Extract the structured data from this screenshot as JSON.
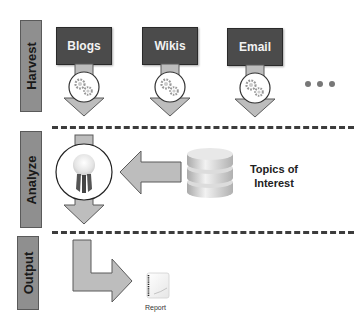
{
  "stages": [
    {
      "id": "harvest",
      "label": "Harvest"
    },
    {
      "id": "analyze",
      "label": "Analyze"
    },
    {
      "id": "output",
      "label": "Output"
    }
  ],
  "harvest": {
    "sources": [
      {
        "label": "Blogs"
      },
      {
        "label": "Wikis"
      },
      {
        "label": "Email"
      }
    ],
    "more_indicator": "ellipsis-dots",
    "process_icon": "gears-icon"
  },
  "analyze": {
    "process_icon": "award-ribbon-icon",
    "input_icon": "database-icon",
    "input_label_line1": "Topics of",
    "input_label_line2": "Interest"
  },
  "output": {
    "artifact_icon": "report-document-icon",
    "artifact_label": "Report"
  },
  "colors": {
    "source_box": "#4b4b4b",
    "stage_bar": "#8f8f8f",
    "arrow_fill": "#bdbdbd",
    "arrow_stroke": "#5a5a5a",
    "dashed_line": "#3c3c3c"
  }
}
